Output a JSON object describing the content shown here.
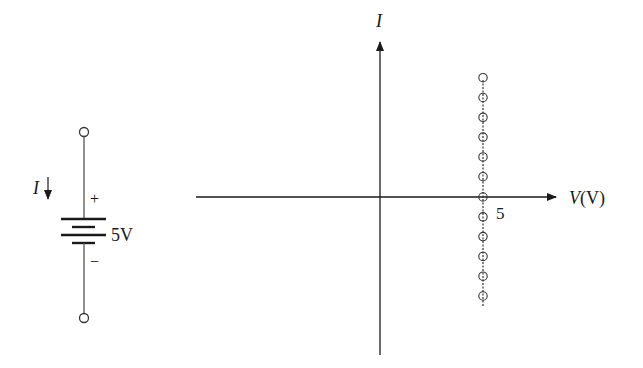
{
  "circuit": {
    "current_label": "I",
    "current_direction": "down",
    "plus_sign": "+",
    "minus_sign": "−",
    "voltage_label": "5V",
    "terminals": 2
  },
  "graph": {
    "y_axis_label": "I",
    "x_axis_label_var": "V",
    "x_axis_label_unit": "(V)",
    "tick_label": "5",
    "line_color": "#1a1a1a"
  },
  "chart_data": {
    "type": "scatter",
    "title": "",
    "xlabel": "V(V)",
    "ylabel": "I",
    "annotations": [
      "5"
    ],
    "x": [
      5,
      5,
      5,
      5,
      5,
      5,
      5,
      5,
      5,
      5,
      5,
      5
    ],
    "y": [
      6,
      5,
      4,
      3,
      2,
      1,
      0,
      -1,
      -2,
      -3,
      -4,
      -5
    ],
    "marker": "open-circle",
    "grid": false,
    "legend": null
  }
}
